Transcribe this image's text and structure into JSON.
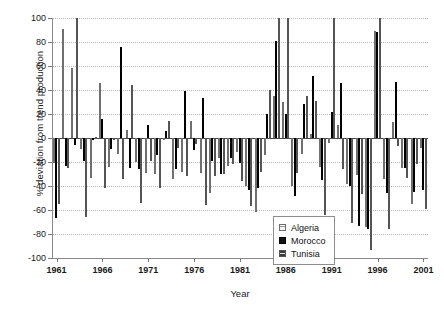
{
  "chart_data": {
    "type": "bar",
    "title": "",
    "xlabel": "Year",
    "ylabel": "% deviation from trend production",
    "ylim": [
      -100,
      100
    ],
    "ytick_step": 20,
    "yticks": [
      100,
      80,
      60,
      40,
      20,
      0,
      -20,
      -40,
      -60,
      -80,
      -100
    ],
    "xlim": [
      1961,
      2001
    ],
    "xticks": [
      1961,
      1966,
      1971,
      1976,
      1981,
      1986,
      1991,
      1996,
      2001
    ],
    "grid": "horizontal-dotted",
    "legend_position": "inside-bottom-center",
    "legend": [
      "Algeria",
      "Morocco",
      "Tunisia"
    ],
    "colors": {
      "Algeria": "#e8e8e8",
      "Morocco": "#121212",
      "Tunisia": "#c9c9c9"
    },
    "x": [
      1961,
      1962,
      1963,
      1964,
      1965,
      1966,
      1967,
      1968,
      1969,
      1970,
      1971,
      1972,
      1973,
      1974,
      1975,
      1976,
      1977,
      1978,
      1979,
      1980,
      1981,
      1982,
      1983,
      1984,
      1985,
      1986,
      1987,
      1988,
      1989,
      1990,
      1991,
      1992,
      1993,
      1994,
      1995,
      1996,
      1997,
      1998,
      1999,
      2000,
      2001
    ],
    "series": [
      {
        "name": "Algeria",
        "values": [
          -21,
          91,
          58,
          -9,
          -33,
          46,
          -24,
          -13,
          7,
          -20,
          -29,
          -30,
          -2,
          -34,
          -28,
          14,
          -29,
          -46,
          -17,
          -23,
          -12,
          -40,
          -62,
          -14,
          35,
          30,
          -40,
          -13,
          3,
          -24,
          -4,
          11,
          -38,
          -31,
          -74,
          89,
          -34,
          13,
          -25,
          -55,
          -8
        ]
      },
      {
        "name": "Morocco",
        "values": [
          -67,
          -23,
          -6,
          -19,
          -2,
          16,
          -9,
          76,
          -25,
          -26,
          11,
          -14,
          6,
          -26,
          39,
          -10,
          33,
          -19,
          -30,
          -17,
          -21,
          -43,
          -42,
          20,
          81,
          20,
          -48,
          28,
          52,
          -35,
          22,
          46,
          -40,
          -73,
          -76,
          88,
          -46,
          47,
          -25,
          -45,
          -43
        ]
      },
      {
        "name": "Tunisia",
        "values": [
          -55,
          -25,
          100,
          -66,
          1,
          -42,
          -2,
          -34,
          44,
          -54,
          -19,
          -42,
          14,
          -8,
          -32,
          -5,
          -56,
          -32,
          -30,
          -22,
          -36,
          -57,
          -28,
          40,
          100,
          100,
          -29,
          35,
          31,
          -64,
          100,
          -26,
          -71,
          -47,
          -93,
          100,
          -76,
          -7,
          -33,
          -22,
          -59
        ]
      }
    ]
  },
  "axes": {
    "y_title": "% deviation from trend production",
    "x_title": "Year"
  }
}
